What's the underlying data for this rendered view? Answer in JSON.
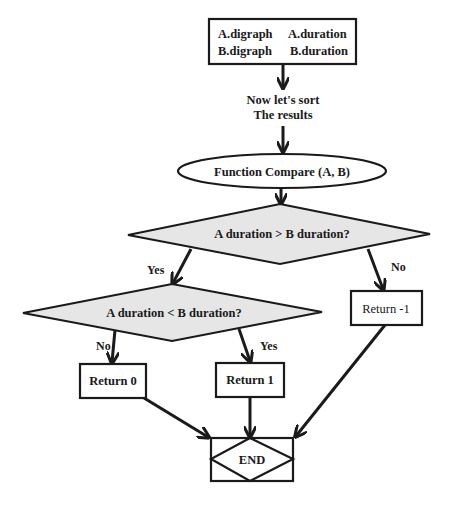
{
  "diagram": {
    "type": "flowchart",
    "nodes": {
      "inputs": {
        "line1_left": "A.digraph",
        "line1_right": "A.duration",
        "line2_left": "B.digraph",
        "line2_right": "B.duration"
      },
      "sort_note": {
        "line1": "Now let's sort",
        "line2": "The results"
      },
      "function": {
        "label": "Function Compare (A, B)"
      },
      "decision1": {
        "label": "A duration > B duration?"
      },
      "decision2": {
        "label": "A duration < B duration?"
      },
      "return_neg1": {
        "label": "Return -1"
      },
      "return_0": {
        "label": "Return 0"
      },
      "return_1": {
        "label": "Return 1"
      },
      "end": {
        "label": "END"
      }
    },
    "edges": {
      "d1_yes": "Yes",
      "d1_no": "No",
      "d2_no": "No",
      "d2_yes": "Yes"
    },
    "colors": {
      "stroke": "#1a1a1a",
      "decision_fill": "#e6e6e6",
      "node_fill": "#ffffff"
    }
  }
}
